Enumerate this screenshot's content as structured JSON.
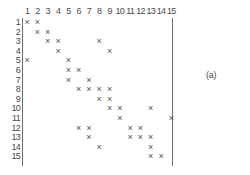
{
  "figure": {
    "panel_label": "(a)",
    "mark_glyph": "×",
    "axis_color": "#6e6e6e",
    "mark_color": "#4f4f4f",
    "label_color": "#4a4a4a",
    "background": "#ffffff"
  },
  "column_labels": [
    "1",
    "2",
    "3",
    "4",
    "5",
    "6",
    "7",
    "8",
    "9",
    "10",
    "11",
    "12",
    "13",
    "14",
    "15"
  ],
  "row_labels": [
    "1",
    "2",
    "3",
    "4",
    "5",
    "6",
    "7",
    "8",
    "9",
    "10",
    "11",
    "12",
    "13",
    "14",
    "15"
  ],
  "chart_data": {
    "type": "heatmap",
    "title": "",
    "subtitle": "",
    "xlabel": "",
    "ylabel": "",
    "grid": false,
    "legend_position": "none",
    "annotations": [
      "(a)"
    ],
    "x": [
      1,
      2,
      3,
      4,
      5,
      6,
      7,
      8,
      9,
      10,
      11,
      12,
      13,
      14,
      15
    ],
    "y": [
      1,
      2,
      3,
      4,
      5,
      6,
      7,
      8,
      9,
      10,
      11,
      12,
      13,
      14,
      15
    ],
    "xlim": [
      1,
      15
    ],
    "ylim": [
      1,
      15
    ],
    "marked_cells": [
      {
        "row": 1,
        "cols": [
          1,
          2
        ]
      },
      {
        "row": 2,
        "cols": [
          2,
          3
        ]
      },
      {
        "row": 3,
        "cols": [
          3,
          4,
          8
        ]
      },
      {
        "row": 4,
        "cols": [
          4,
          9
        ]
      },
      {
        "row": 5,
        "cols": [
          1,
          5
        ]
      },
      {
        "row": 6,
        "cols": [
          5,
          6
        ]
      },
      {
        "row": 7,
        "cols": [
          5,
          7
        ]
      },
      {
        "row": 8,
        "cols": [
          6,
          7,
          8,
          9
        ]
      },
      {
        "row": 9,
        "cols": [
          8,
          9
        ]
      },
      {
        "row": 10,
        "cols": [
          9,
          10,
          13
        ]
      },
      {
        "row": 11,
        "cols": [
          10,
          15
        ]
      },
      {
        "row": 12,
        "cols": [
          6,
          7,
          11,
          12
        ]
      },
      {
        "row": 13,
        "cols": [
          7,
          11,
          12,
          13
        ]
      },
      {
        "row": 14,
        "cols": [
          8,
          13
        ]
      },
      {
        "row": 15,
        "cols": [
          13,
          14
        ]
      }
    ],
    "matrix": [
      [
        1,
        1,
        0,
        0,
        0,
        0,
        0,
        0,
        0,
        0,
        0,
        0,
        0,
        0,
        0
      ],
      [
        0,
        1,
        1,
        0,
        0,
        0,
        0,
        0,
        0,
        0,
        0,
        0,
        0,
        0,
        0
      ],
      [
        0,
        0,
        1,
        1,
        0,
        0,
        0,
        1,
        0,
        0,
        0,
        0,
        0,
        0,
        0
      ],
      [
        0,
        0,
        0,
        1,
        0,
        0,
        0,
        0,
        1,
        0,
        0,
        0,
        0,
        0,
        0
      ],
      [
        1,
        0,
        0,
        0,
        1,
        0,
        0,
        0,
        0,
        0,
        0,
        0,
        0,
        0,
        0
      ],
      [
        0,
        0,
        0,
        0,
        1,
        1,
        0,
        0,
        0,
        0,
        0,
        0,
        0,
        0,
        0
      ],
      [
        0,
        0,
        0,
        0,
        1,
        0,
        1,
        0,
        0,
        0,
        0,
        0,
        0,
        0,
        0
      ],
      [
        0,
        0,
        0,
        0,
        0,
        1,
        1,
        1,
        1,
        0,
        0,
        0,
        0,
        0,
        0
      ],
      [
        0,
        0,
        0,
        0,
        0,
        0,
        0,
        1,
        1,
        0,
        0,
        0,
        0,
        0,
        0
      ],
      [
        0,
        0,
        0,
        0,
        0,
        0,
        0,
        0,
        1,
        1,
        0,
        0,
        1,
        0,
        0
      ],
      [
        0,
        0,
        0,
        0,
        0,
        0,
        0,
        0,
        0,
        1,
        0,
        0,
        0,
        0,
        1
      ],
      [
        0,
        0,
        0,
        0,
        0,
        1,
        1,
        0,
        0,
        0,
        1,
        1,
        0,
        0,
        0
      ],
      [
        0,
        0,
        0,
        0,
        0,
        0,
        1,
        0,
        0,
        0,
        1,
        1,
        1,
        0,
        0
      ],
      [
        0,
        0,
        0,
        0,
        0,
        0,
        0,
        1,
        0,
        0,
        0,
        0,
        1,
        0,
        0
      ],
      [
        0,
        0,
        0,
        0,
        0,
        0,
        0,
        0,
        0,
        0,
        0,
        0,
        1,
        1,
        0
      ]
    ],
    "row_counts": [
      2,
      2,
      3,
      2,
      2,
      2,
      2,
      4,
      2,
      3,
      2,
      4,
      4,
      2,
      2
    ],
    "total_marks": 38
  }
}
